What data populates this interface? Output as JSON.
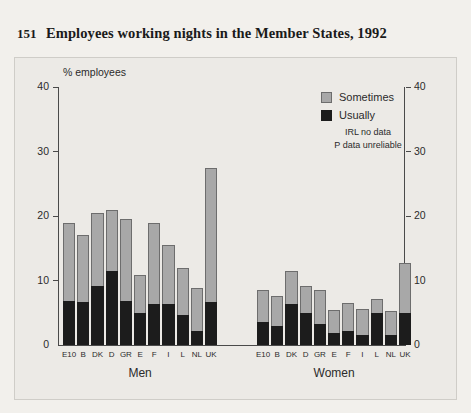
{
  "figure": {
    "number": "151",
    "title": "Employees working nights in the Member States, 1992"
  },
  "legend": {
    "sometimes_label": "Sometimes",
    "usually_label": "Usually",
    "note_1": "IRL no data",
    "note_2": "P data unreliable"
  },
  "colors": {
    "sometimes": "#a8a8a8",
    "usually": "#1c1c1c",
    "panel_background": "#eceae6",
    "page_background": "#f2f0ec",
    "axis": "#4a4a4a"
  },
  "chart_data": {
    "type": "bar",
    "title": "Employees working nights in the Member States, 1992",
    "subtitle": "",
    "xlabel": "",
    "ylabel": "% employees",
    "ylim": [
      0,
      40
    ],
    "yticks": [
      0,
      10,
      20,
      30,
      40
    ],
    "ytick_labels": [
      "0",
      "10",
      "20",
      "30",
      "40"
    ],
    "grid": false,
    "legend_position": "top-right",
    "stacked": true,
    "dual_axis": true,
    "panels": [
      {
        "name": "Men",
        "label": "Men",
        "categories": [
          "E10",
          "B",
          "DK",
          "D",
          "GR",
          "E",
          "F",
          "I",
          "L",
          "NL",
          "UK"
        ],
        "series": [
          {
            "name": "Usually",
            "values": [
              6.9,
              6.6,
              9.2,
              11.4,
              6.8,
              5.0,
              6.3,
              6.3,
              4.6,
              2.1,
              6.7
            ]
          },
          {
            "name": "Sometimes",
            "values": [
              12.0,
              10.4,
              11.2,
              9.5,
              12.8,
              5.9,
              12.6,
              9.2,
              7.4,
              6.7,
              20.8
            ]
          }
        ],
        "totals": [
          18.9,
          17.0,
          20.4,
          20.9,
          19.6,
          10.9,
          18.9,
          15.5,
          12.0,
          8.8,
          27.5
        ]
      },
      {
        "name": "Women",
        "label": "Women",
        "categories": [
          "E10",
          "B",
          "DK",
          "D",
          "GR",
          "E",
          "F",
          "I",
          "L",
          "NL",
          "UK"
        ],
        "series": [
          {
            "name": "Usually",
            "values": [
              3.6,
              3.0,
              6.4,
              5.0,
              3.3,
              1.9,
              2.2,
              1.6,
              4.9,
              1.5,
              5.0
            ]
          },
          {
            "name": "Sometimes",
            "values": [
              4.9,
              4.6,
              5.0,
              4.2,
              5.3,
              3.5,
              4.3,
              4.0,
              2.3,
              3.8,
              7.7
            ]
          }
        ],
        "totals": [
          8.5,
          7.6,
          11.4,
          9.2,
          8.6,
          5.4,
          6.5,
          5.6,
          7.2,
          5.3,
          12.7
        ]
      }
    ],
    "annotations": [
      "IRL no data",
      "P data unreliable"
    ]
  }
}
